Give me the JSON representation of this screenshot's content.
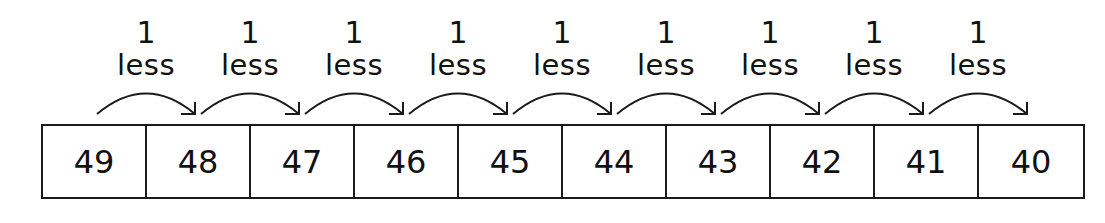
{
  "diagram": {
    "step_label": {
      "amount": "1",
      "word": "less"
    },
    "numbers": [
      "49",
      "48",
      "47",
      "46",
      "45",
      "44",
      "43",
      "42",
      "41",
      "40"
    ],
    "jumps": [
      {
        "from": "49",
        "to": "48",
        "amount": "1",
        "word": "less"
      },
      {
        "from": "48",
        "to": "47",
        "amount": "1",
        "word": "less"
      },
      {
        "from": "47",
        "to": "46",
        "amount": "1",
        "word": "less"
      },
      {
        "from": "46",
        "to": "45",
        "amount": "1",
        "word": "less"
      },
      {
        "from": "45",
        "to": "44",
        "amount": "1",
        "word": "less"
      },
      {
        "from": "44",
        "to": "43",
        "amount": "1",
        "word": "less"
      },
      {
        "from": "43",
        "to": "42",
        "amount": "1",
        "word": "less"
      },
      {
        "from": "42",
        "to": "41",
        "amount": "1",
        "word": "less"
      },
      {
        "from": "41",
        "to": "40",
        "amount": "1",
        "word": "less"
      }
    ],
    "line_color": "#1a1a1a",
    "background_color": "#ffffff"
  }
}
